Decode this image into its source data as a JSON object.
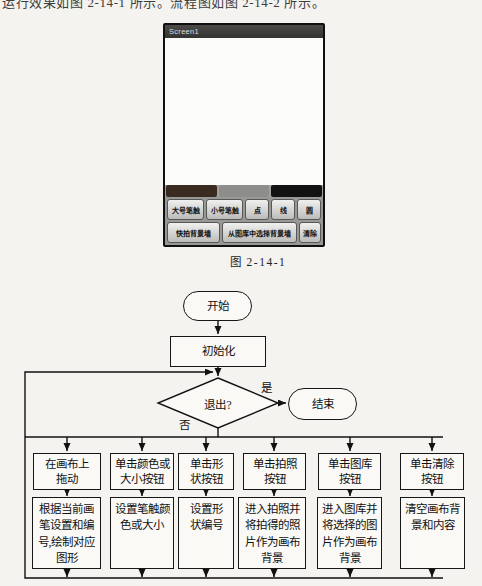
{
  "page": {
    "intro_text": "运行效果如图 2-14-1 所示。流程图如图 2-14-2 所示。",
    "figure_caption": "图 2-14-1"
  },
  "phone": {
    "title_bar": "Screen1",
    "swatch_colors": {
      "red": "#3a2b21",
      "green": "#8d8d8b",
      "blue": "#121212"
    },
    "buttons_row1": [
      {
        "label": "大号笔触"
      },
      {
        "label": "小号笔触"
      },
      {
        "label": "点"
      },
      {
        "label": "线"
      },
      {
        "label": "圆"
      }
    ],
    "buttons_row2": [
      {
        "label": "快拍背景墙"
      },
      {
        "label": "从图库中选择背景墙"
      },
      {
        "label": "清除"
      }
    ]
  },
  "flowchart": {
    "start_label": "开始",
    "init_label": "初始化",
    "decision_label": "退出?",
    "yes_label": "是",
    "no_label": "否",
    "end_label": "结束",
    "branches": [
      {
        "action": "在画布上\n拖动",
        "result": "根据当前画\n笔设置和编\n号,绘制对应\n图形"
      },
      {
        "action": "单击颜色或\n大小按钮",
        "result": "设置笔触颜\n色或大小"
      },
      {
        "action": "单击形\n状按钮",
        "result": "设置形\n状编号"
      },
      {
        "action": "单击拍照\n按钮",
        "result": "进入拍照并\n将拍得的照\n片作为画布\n背景"
      },
      {
        "action": "单击图库\n按钮",
        "result": "进入图库并\n将选择的图\n片作为画布\n背景"
      },
      {
        "action": "单击清除\n按钮",
        "result": "清空画布背\n景和内容"
      }
    ]
  }
}
